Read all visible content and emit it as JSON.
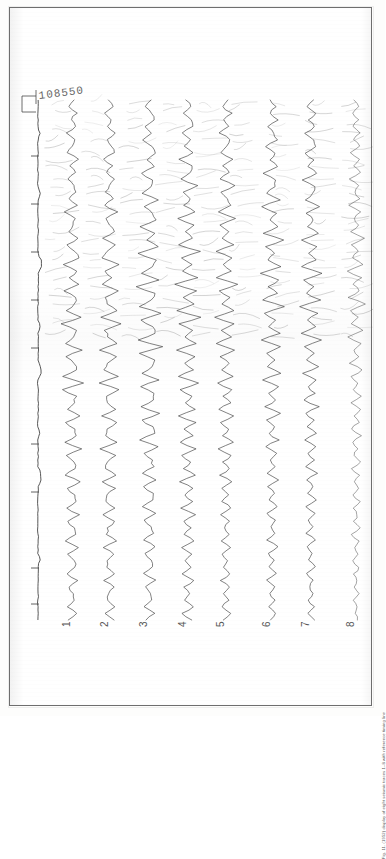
{
  "document": {
    "kind": "scanned-seismic-record",
    "record_number": "108550",
    "caption": "Fig. 11. (1952) display of eight seismic traces 1–8 with reference timing line"
  },
  "frame": {
    "border_color": "#6e6e6e",
    "paper_color": "#ffffff"
  },
  "reference_trace": {
    "name": "timing-reference-line",
    "x": 28,
    "top": 104,
    "bottom": 600,
    "ticks": [
      148,
      196,
      244,
      292,
      340,
      436,
      484,
      560,
      596
    ]
  },
  "trace_labels": [
    {
      "label": "1",
      "x": 62
    },
    {
      "label": "2",
      "x": 100
    },
    {
      "label": "3",
      "x": 139
    },
    {
      "label": "4",
      "x": 178
    },
    {
      "label": "5",
      "x": 216
    },
    {
      "label": "6",
      "x": 262
    },
    {
      "label": "7",
      "x": 301
    },
    {
      "label": "8",
      "x": 346
    }
  ],
  "chart_data": {
    "type": "line",
    "title": "",
    "subtitle": "",
    "xlabel": "",
    "ylabel": "",
    "orientation": "vertical-wiggle",
    "grid": false,
    "legend": null,
    "record_number": "108550",
    "n_traces": 8,
    "trace_names": [
      "1",
      "2",
      "3",
      "4",
      "5",
      "6",
      "7",
      "8"
    ],
    "trace_base_x": [
      62,
      100,
      139,
      178,
      216,
      262,
      301,
      346
    ],
    "y_range": [
      92,
      612
    ],
    "amplitude_scale": 13,
    "note": "Each trace is a vertical time series; amplitude deflects horizontally about its base x. Samples listed top(92px) to bottom(612px) in normalized amplitude units (-1..1).",
    "series": [
      {
        "name": "1",
        "values": [
          0.12,
          -0.25,
          0.35,
          -0.1,
          0.28,
          -0.4,
          0.18,
          0.05,
          -0.32,
          0.44,
          -0.15,
          0.22,
          -0.38,
          0.1,
          0.3,
          -0.2,
          0.42,
          -0.55,
          0.25,
          0.08,
          -0.3,
          0.5,
          -0.35,
          0.15,
          0.6,
          -0.72,
          0.4,
          -0.18,
          0.55,
          -0.62,
          0.3,
          0.22,
          -0.45,
          0.68,
          -0.8,
          0.35,
          0.1,
          -0.55,
          0.75,
          -0.48,
          0.2,
          0.4,
          -0.65,
          0.88,
          -0.7,
          0.3,
          0.15,
          -0.4,
          0.6,
          -0.52,
          0.25,
          0.35,
          -0.58,
          0.7,
          -0.45,
          0.18,
          0.28,
          -0.5,
          0.62,
          -0.38,
          0.22,
          0.3,
          -0.42,
          0.55,
          -0.35,
          0.15,
          0.25,
          -0.45,
          0.5,
          -0.3,
          0.18,
          0.22,
          -0.38,
          0.44,
          -0.28,
          0.12,
          0.2,
          -0.34,
          0.4,
          -0.25
        ]
      },
      {
        "name": "2",
        "values": [
          -0.18,
          0.3,
          -0.42,
          0.12,
          -0.25,
          0.38,
          -0.15,
          0.08,
          0.35,
          -0.48,
          0.2,
          -0.28,
          0.4,
          -0.12,
          -0.32,
          0.25,
          -0.45,
          0.58,
          -0.28,
          -0.1,
          0.35,
          -0.52,
          0.38,
          -0.18,
          -0.62,
          0.75,
          -0.42,
          0.2,
          -0.58,
          0.65,
          -0.32,
          -0.25,
          0.48,
          -0.7,
          0.82,
          -0.38,
          -0.12,
          0.58,
          -0.78,
          0.5,
          -0.22,
          -0.42,
          0.68,
          -0.9,
          0.72,
          -0.32,
          -0.18,
          0.42,
          -0.62,
          0.55,
          -0.28,
          -0.38,
          0.6,
          -0.72,
          0.48,
          -0.2,
          -0.3,
          0.52,
          -0.64,
          0.4,
          -0.24,
          -0.32,
          0.44,
          -0.58,
          0.36,
          -0.16,
          -0.26,
          0.46,
          -0.52,
          0.32,
          -0.2,
          -0.24,
          0.4,
          -0.46,
          0.3,
          -0.14,
          -0.22,
          0.36,
          -0.42,
          0.26
        ]
      },
      {
        "name": "3",
        "values": [
          0.22,
          -0.35,
          0.18,
          0.4,
          -0.28,
          0.12,
          -0.45,
          0.3,
          0.55,
          -0.2,
          0.38,
          -0.62,
          0.25,
          0.15,
          -0.48,
          0.7,
          -0.35,
          0.28,
          0.52,
          -0.75,
          0.42,
          -0.18,
          0.65,
          -0.88,
          0.5,
          0.3,
          -0.58,
          0.8,
          -0.95,
          0.45,
          0.2,
          -0.68,
          0.92,
          -0.6,
          0.32,
          0.48,
          -0.82,
          1.0,
          -0.72,
          0.38,
          0.25,
          -0.55,
          0.78,
          -0.68,
          0.42,
          0.3,
          -0.62,
          0.85,
          -0.58,
          0.26,
          0.4,
          -0.7,
          0.64,
          -0.38,
          0.22,
          0.34,
          -0.56,
          0.6,
          -0.42,
          0.28,
          0.32,
          -0.48,
          0.54,
          -0.34,
          0.2,
          0.3,
          -0.44,
          0.5,
          -0.3,
          0.18,
          0.26,
          -0.4,
          0.46,
          -0.28,
          0.16,
          0.24,
          -0.36,
          0.42,
          -0.24
        ]
      },
      {
        "name": "4",
        "values": [
          -0.15,
          0.28,
          -0.38,
          0.2,
          0.32,
          -0.5,
          0.15,
          -0.25,
          0.45,
          -0.65,
          0.3,
          0.18,
          -0.55,
          0.72,
          -0.4,
          0.22,
          -0.32,
          0.58,
          -0.8,
          0.48,
          -0.2,
          0.38,
          -0.68,
          0.9,
          -0.55,
          0.25,
          -0.42,
          0.75,
          -0.98,
          0.6,
          -0.3,
          0.45,
          -0.82,
          1.0,
          -0.7,
          0.35,
          -0.25,
          0.62,
          -0.88,
          0.52,
          -0.28,
          0.4,
          -0.72,
          0.8,
          -0.6,
          0.32,
          -0.22,
          0.55,
          -0.76,
          0.58,
          -0.3,
          0.36,
          -0.64,
          0.68,
          -0.44,
          0.24,
          -0.32,
          0.58,
          -0.6,
          0.38,
          -0.26,
          0.3,
          -0.5,
          0.56,
          -0.34,
          0.2,
          -0.28,
          0.46,
          -0.5,
          0.3,
          -0.18,
          0.24,
          -0.4,
          0.44,
          -0.26,
          0.16,
          -0.22,
          0.36,
          -0.4,
          0.24
        ]
      },
      {
        "name": "5",
        "values": [
          0.18,
          -0.3,
          0.42,
          -0.15,
          0.25,
          -0.48,
          0.32,
          0.1,
          -0.4,
          0.58,
          -0.25,
          0.2,
          -0.52,
          0.68,
          -0.35,
          0.15,
          0.38,
          -0.62,
          0.75,
          -0.42,
          0.22,
          -0.3,
          0.55,
          -0.82,
          0.48,
          -0.25,
          0.35,
          -0.7,
          0.88,
          -0.52,
          0.28,
          -0.38,
          0.66,
          -0.92,
          0.58,
          -0.32,
          0.42,
          -0.78,
          0.72,
          -0.48,
          0.25,
          -0.35,
          0.6,
          -0.68,
          0.5,
          -0.28,
          0.32,
          -0.58,
          0.62,
          -0.4,
          0.22,
          -0.3,
          0.52,
          -0.56,
          0.36,
          -0.2,
          0.28,
          -0.46,
          0.5,
          -0.32,
          0.18,
          -0.26,
          0.42,
          -0.46,
          0.28,
          -0.16,
          0.24,
          -0.38,
          0.42,
          -0.26,
          0.15,
          -0.22,
          0.34,
          -0.38,
          0.24,
          -0.14,
          0.2,
          -0.3,
          0.34,
          -0.2
        ]
      },
      {
        "name": "6",
        "values": [
          -0.2,
          0.32,
          -0.18,
          0.45,
          -0.3,
          0.12,
          0.38,
          -0.55,
          0.22,
          -0.15,
          0.48,
          -0.68,
          0.3,
          0.18,
          -0.42,
          0.62,
          -0.8,
          0.38,
          -0.2,
          0.5,
          -0.72,
          0.88,
          -0.45,
          0.25,
          -0.35,
          0.68,
          -0.95,
          0.55,
          -0.28,
          0.4,
          -0.75,
          0.9,
          -0.62,
          0.32,
          -0.22,
          0.58,
          -0.85,
          0.68,
          -0.42,
          0.24,
          -0.32,
          0.62,
          -0.7,
          0.48,
          -0.26,
          0.34,
          -0.56,
          0.6,
          -0.38,
          0.2,
          -0.28,
          0.5,
          -0.54,
          0.34,
          -0.18,
          0.26,
          -0.44,
          0.48,
          -0.3,
          0.16,
          -0.24,
          0.4,
          -0.44,
          0.26,
          -0.14,
          0.22,
          -0.36,
          0.4,
          -0.24,
          0.14,
          -0.2,
          0.32,
          -0.36,
          0.22,
          -0.12,
          0.18,
          -0.28,
          0.32,
          -0.18
        ]
      },
      {
        "name": "7",
        "values": [
          0.15,
          -0.28,
          0.38,
          -0.2,
          0.3,
          -0.45,
          0.18,
          0.32,
          -0.52,
          0.25,
          -0.18,
          0.48,
          -0.65,
          0.32,
          0.15,
          -0.45,
          0.7,
          -0.38,
          0.22,
          -0.3,
          0.58,
          -0.78,
          0.42,
          -0.24,
          0.36,
          -0.66,
          0.85,
          -0.5,
          0.26,
          -0.38,
          0.7,
          -0.88,
          0.58,
          -0.3,
          0.4,
          -0.72,
          0.78,
          -0.46,
          0.24,
          -0.34,
          0.62,
          -0.66,
          0.44,
          -0.26,
          0.32,
          -0.54,
          0.58,
          -0.36,
          0.2,
          -0.28,
          0.48,
          -0.52,
          0.34,
          -0.18,
          0.26,
          -0.42,
          0.46,
          -0.28,
          0.16,
          -0.22,
          0.38,
          -0.42,
          0.26,
          -0.15,
          0.2,
          -0.34,
          0.38,
          -0.22,
          0.14,
          -0.2,
          0.3,
          -0.34,
          0.2,
          -0.12,
          0.18,
          -0.26,
          0.3,
          -0.18,
          0.22
        ]
      },
      {
        "name": "8",
        "values": [
          -0.12,
          0.22,
          -0.3,
          0.15,
          -0.24,
          0.36,
          -0.18,
          0.26,
          -0.4,
          0.2,
          -0.15,
          0.38,
          -0.5,
          0.25,
          -0.12,
          0.34,
          -0.55,
          0.3,
          -0.18,
          0.24,
          -0.45,
          0.6,
          -0.32,
          0.18,
          -0.28,
          0.52,
          -0.68,
          0.38,
          -0.2,
          0.3,
          -0.56,
          0.7,
          -0.44,
          0.24,
          -0.32,
          0.58,
          -0.62,
          0.36,
          -0.18,
          0.26,
          -0.48,
          0.52,
          -0.34,
          0.2,
          -0.26,
          0.42,
          -0.46,
          0.28,
          -0.16,
          0.22,
          -0.38,
          0.42,
          -0.26,
          0.14,
          -0.2,
          0.34,
          -0.38,
          0.22,
          -0.12,
          0.18,
          -0.3,
          0.34,
          -0.2,
          0.12,
          -0.16,
          0.26,
          -0.3,
          0.18,
          -0.1,
          0.14,
          -0.24,
          0.26,
          -0.16,
          0.1,
          -0.14,
          0.22,
          -0.24,
          0.14,
          -0.08,
          0.12
        ]
      }
    ],
    "reference_series": {
      "name": "reference-timing-trace",
      "base_x": 28,
      "values": [
        0,
        0,
        0,
        0,
        0,
        0.25,
        0,
        0,
        0,
        0,
        0,
        0,
        0,
        0,
        0.3,
        0,
        0,
        0,
        0,
        0,
        0,
        0,
        0,
        0,
        0.45,
        0.5,
        0,
        0,
        0,
        0,
        0,
        0,
        0,
        0,
        0.28,
        0,
        0,
        0,
        0,
        0,
        0.35,
        0.4,
        0,
        0,
        0,
        0,
        0,
        0,
        0,
        0,
        0.22,
        0,
        0,
        0,
        0,
        0,
        0.38,
        0.42,
        0,
        0,
        0,
        0,
        0,
        0,
        0,
        0,
        0,
        0,
        0,
        0.3,
        0,
        0,
        0,
        0,
        0,
        0,
        0,
        0,
        0
      ]
    }
  }
}
